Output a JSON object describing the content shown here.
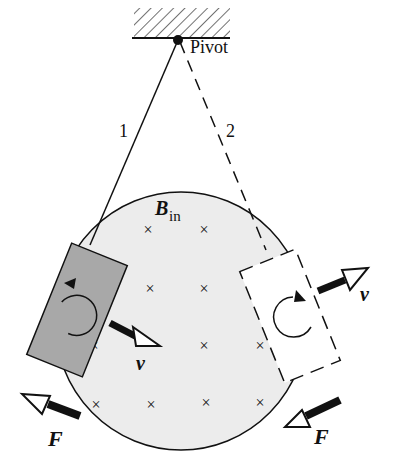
{
  "diagram": {
    "pivot_label": "Pivot",
    "position_1_label": "1",
    "position_2_label": "2",
    "field_label_main": "B",
    "field_label_sub": "in",
    "velocity_label_left": "v",
    "velocity_label_right": "v",
    "force_label_left": "F",
    "force_label_right": "F",
    "field_marker": "×",
    "colors": {
      "field_region": "#ececec",
      "loop_1_fill": "#a8a8a8",
      "loop_2_fill": "#ffffff",
      "ink": "#111111"
    }
  }
}
